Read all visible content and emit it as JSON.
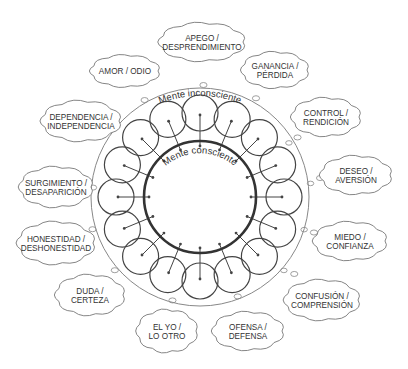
{
  "diagram": {
    "center": {
      "x": 200,
      "y": 197
    },
    "conscious_mind": {
      "label": "Mente consciente",
      "radius": 56,
      "stroke": "#333333"
    },
    "unconscious_mind": {
      "label": "Mente inconsciente",
      "radius": 109,
      "stroke": "#888888"
    },
    "satellites": {
      "count": 16,
      "orbit_radius": 84,
      "radius": 18
    },
    "clouds": [
      {
        "id": "apego",
        "line1": "APEGO /",
        "line2": "DESPRENDIMIENTO",
        "x": 202,
        "y": 42,
        "w": 82,
        "h": 36
      },
      {
        "id": "ganancia",
        "line1": "GANANCIA /",
        "line2": "PÉRDIDA",
        "x": 275,
        "y": 70,
        "w": 64,
        "h": 34
      },
      {
        "id": "control",
        "line1": "CONTROL /",
        "line2": "RENDICIÓN",
        "x": 326,
        "y": 117,
        "w": 66,
        "h": 36
      },
      {
        "id": "deseo",
        "line1": "DESEO /",
        "line2": "AVERSIÓN",
        "x": 356,
        "y": 175,
        "w": 68,
        "h": 36
      },
      {
        "id": "miedo",
        "line1": "MIEDO /",
        "line2": "CONFIANZA",
        "x": 350,
        "y": 241,
        "w": 70,
        "h": 36
      },
      {
        "id": "confusion",
        "line1": "CONFUSIÓN /",
        "line2": "COMPRENSIÓN",
        "x": 322,
        "y": 300,
        "w": 72,
        "h": 38
      },
      {
        "id": "ofensa",
        "line1": "OFENSA /",
        "line2": "DEFENSA",
        "x": 248,
        "y": 331,
        "w": 68,
        "h": 36
      },
      {
        "id": "yo",
        "line1": "EL YO /",
        "line2": "LO OTRO",
        "x": 167,
        "y": 331,
        "w": 58,
        "h": 40
      },
      {
        "id": "duda",
        "line1": "DUDA /",
        "line2": "CERTEZA",
        "x": 90,
        "y": 295,
        "w": 66,
        "h": 38
      },
      {
        "id": "honestidad",
        "line1": "HONESTIDAD /",
        "line2": "DESHONESTIDAD",
        "x": 56,
        "y": 243,
        "w": 74,
        "h": 40
      },
      {
        "id": "surgimiento",
        "line1": "SURGIMIENTO /",
        "line2": "DESAPARICIÓN",
        "x": 56,
        "y": 187,
        "w": 70,
        "h": 38
      },
      {
        "id": "dependencia",
        "line1": "DEPENDENCIA /",
        "line2": "INDEPENDENCIA",
        "x": 81,
        "y": 121,
        "w": 76,
        "h": 38
      },
      {
        "id": "amor",
        "line1": "AMOR / ODIO",
        "line2": "",
        "x": 125,
        "y": 71,
        "w": 66,
        "h": 30
      }
    ]
  }
}
